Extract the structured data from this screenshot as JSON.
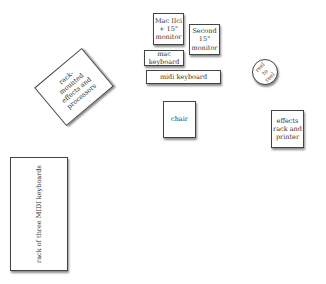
{
  "diagram": {
    "items": [
      {
        "id": "mac",
        "label": "Mac IIci + 15\" monitor"
      },
      {
        "id": "second-monitor",
        "label": "Second 15\" monitor"
      },
      {
        "id": "mac-keyboard",
        "label": "mac keyboard"
      },
      {
        "id": "midi-keyboard",
        "label": "midi keyboard"
      },
      {
        "id": "reel-to-reel",
        "label": "reel to reel"
      },
      {
        "id": "chair",
        "label": "chair"
      },
      {
        "id": "effects-rack-printer",
        "label": "effects rack and printer"
      },
      {
        "id": "rack-effects",
        "label": "rack-mounted effects and processors"
      },
      {
        "id": "midi-rack",
        "label": "rack of three MIDI keyboards"
      }
    ]
  }
}
